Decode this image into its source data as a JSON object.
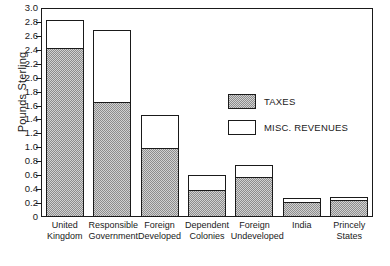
{
  "chart_data": {
    "type": "bar",
    "stacked": true,
    "title": "",
    "xlabel": "",
    "ylabel": "Pounds Sterling",
    "ylim": [
      0,
      3.0
    ],
    "ytick_labels": [
      "3.0",
      "2.8",
      "2.6",
      "2.4",
      "2.2",
      "2.0",
      "1.8",
      "1.6",
      "1.4",
      "1.2",
      "1.0",
      "0.8",
      "0.6",
      "0.4",
      "0.2",
      "0"
    ],
    "ytick_values": [
      3.0,
      2.8,
      2.6,
      2.4,
      2.2,
      2.0,
      1.8,
      1.6,
      1.4,
      1.2,
      1.0,
      0.8,
      0.6,
      0.4,
      0.2,
      0
    ],
    "grid": false,
    "legend_position": "center-right",
    "categories": [
      "United Kingdom",
      "Responsible Government",
      "Foreign Developed",
      "Dependent Colonies",
      "Foreign Undeveloped",
      "India",
      "Princely States"
    ],
    "category_lines": [
      [
        "United",
        "Kingdom"
      ],
      [
        "Responsible",
        "Government"
      ],
      [
        "Foreign",
        "Developed"
      ],
      [
        "Dependent",
        "Colonies"
      ],
      [
        "Foreign",
        "Undeveloped"
      ],
      [
        "India"
      ],
      [
        "Princely",
        "States"
      ]
    ],
    "series": [
      {
        "name": "TAXES",
        "fill": "hatched-gray",
        "values": [
          2.41,
          1.63,
          0.97,
          0.37,
          0.56,
          0.2,
          0.23
        ]
      },
      {
        "name": "MISC. REVENUES",
        "fill": "white",
        "values": [
          0.42,
          1.06,
          0.49,
          0.24,
          0.18,
          0.08,
          0.06
        ]
      }
    ],
    "totals": [
      2.83,
      2.69,
      1.46,
      0.61,
      0.74,
      0.28,
      0.29
    ]
  },
  "legend": {
    "items": [
      {
        "label": "TAXES",
        "swatch": "taxes"
      },
      {
        "label": "MISC. REVENUES",
        "swatch": "misc"
      }
    ]
  },
  "axis": {
    "y_title": "Pounds Sterling"
  }
}
